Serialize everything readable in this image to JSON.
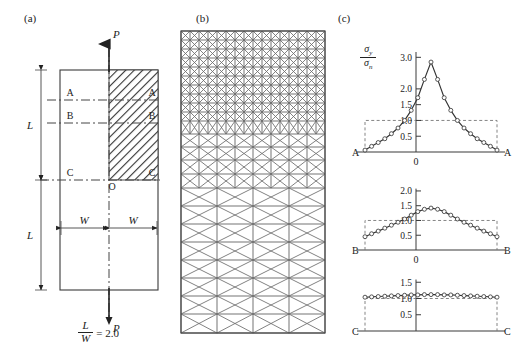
{
  "figure": {
    "panels": [
      {
        "id": "a",
        "label": "(a)",
        "x": 24,
        "y": 12
      },
      {
        "id": "b",
        "label": "(b)",
        "x": 196,
        "y": 12
      },
      {
        "id": "c",
        "label": "(c)",
        "x": 338,
        "y": 12
      }
    ]
  },
  "panel_a": {
    "title": "(a)",
    "load_label_top": "P",
    "load_label_bottom": "P",
    "origin_label": "O",
    "height_label_upper": "L",
    "height_label_lower": "L",
    "width_label_left": "W",
    "width_label_right": "W",
    "section_labels_left": [
      "A",
      "B",
      "C"
    ],
    "section_labels_right": [
      "A",
      "B",
      "C"
    ],
    "aspect_ratio_numerator": "L",
    "aspect_ratio_denominator": "W",
    "aspect_ratio_value": "= 2.0",
    "hatch_description": "hatched quadrant (modelled region)"
  },
  "panel_b": {
    "title": "(b)",
    "description": "graded finite element mesh of the modelled quadrant",
    "edge_section_labels": [
      "A",
      "B",
      "C"
    ]
  },
  "panel_c": {
    "title": "(c)",
    "y_axis_numerator": "σ",
    "y_axis_numerator_sub": "y",
    "y_axis_denominator": "σ",
    "y_axis_denominator_sub": "n",
    "plots": [
      {
        "name": "section-A",
        "left_label": "A",
        "right_label": "A",
        "origin_label": "0",
        "yticks": [
          "3.0",
          "2.0",
          "1.5",
          "1.0",
          "0.5"
        ],
        "ytick_values": [
          3.0,
          2.0,
          1.5,
          1.0,
          0.5
        ],
        "reference_level": 1.0,
        "peak": 2.85
      },
      {
        "name": "section-B",
        "left_label": "B",
        "right_label": "B",
        "origin_label": "0",
        "yticks": [
          "2.0",
          "1.5",
          "1.0",
          "0.5"
        ],
        "ytick_values": [
          2.0,
          1.5,
          1.0,
          0.5
        ],
        "reference_level": 1.0,
        "peak": 1.42
      },
      {
        "name": "section-C",
        "left_label": "C",
        "right_label": "C",
        "origin_label": "",
        "yticks": [
          "1.5",
          "1.0",
          "0.5"
        ],
        "ytick_values": [
          1.5,
          1.0,
          0.5
        ],
        "reference_level": 1.0,
        "peak": 1.12
      }
    ]
  },
  "chart_data": [
    {
      "type": "line",
      "name": "section-A",
      "title": "",
      "xlabel": "",
      "ylabel": "sigma_y / sigma_n",
      "xlim": [
        -1,
        1
      ],
      "ylim": [
        0,
        3.2
      ],
      "ytick_values": [
        0.5,
        1.0,
        1.5,
        2.0,
        3.0
      ],
      "reference_line": 1.0,
      "grid": false,
      "legend": false,
      "x": [
        -1.0,
        -0.9,
        -0.8,
        -0.7,
        -0.6,
        -0.5,
        -0.4,
        -0.3,
        -0.2,
        -0.1,
        0.0,
        0.1,
        0.2,
        0.3,
        0.4,
        0.5,
        0.6,
        0.7,
        0.8,
        0.9,
        1.0
      ],
      "y": [
        0.06,
        0.18,
        0.3,
        0.42,
        0.58,
        0.76,
        1.0,
        1.32,
        1.72,
        2.3,
        2.85,
        2.3,
        1.72,
        1.32,
        1.0,
        0.76,
        0.58,
        0.42,
        0.3,
        0.18,
        0.06
      ]
    },
    {
      "type": "line",
      "name": "section-B",
      "title": "",
      "xlabel": "",
      "ylabel": "sigma_y / sigma_n",
      "xlim": [
        -1,
        1
      ],
      "ylim": [
        0,
        2.1
      ],
      "ytick_values": [
        0.5,
        1.0,
        1.5,
        2.0
      ],
      "reference_line": 1.0,
      "grid": false,
      "legend": false,
      "x": [
        -1.0,
        -0.9,
        -0.8,
        -0.7,
        -0.6,
        -0.5,
        -0.4,
        -0.3,
        -0.2,
        -0.1,
        0.0,
        0.1,
        0.2,
        0.3,
        0.4,
        0.5,
        0.6,
        0.7,
        0.8,
        0.9,
        1.0
      ],
      "y": [
        0.45,
        0.55,
        0.64,
        0.74,
        0.84,
        0.94,
        1.05,
        1.18,
        1.3,
        1.38,
        1.42,
        1.38,
        1.3,
        1.18,
        1.05,
        0.94,
        0.84,
        0.74,
        0.64,
        0.55,
        0.45
      ]
    },
    {
      "type": "line",
      "name": "section-C",
      "title": "",
      "xlabel": "",
      "ylabel": "sigma_y / sigma_n",
      "xlim": [
        -1,
        1
      ],
      "ylim": [
        0,
        1.6
      ],
      "ytick_values": [
        0.5,
        1.0,
        1.5
      ],
      "reference_line": 1.0,
      "grid": false,
      "legend": false,
      "x": [
        -1.0,
        -0.9,
        -0.8,
        -0.7,
        -0.6,
        -0.5,
        -0.4,
        -0.3,
        -0.2,
        -0.1,
        0.0,
        0.1,
        0.2,
        0.3,
        0.4,
        0.5,
        0.6,
        0.7,
        0.8,
        0.9,
        1.0
      ],
      "y": [
        1.04,
        1.05,
        1.06,
        1.07,
        1.08,
        1.09,
        1.1,
        1.11,
        1.11,
        1.12,
        1.12,
        1.12,
        1.11,
        1.11,
        1.1,
        1.09,
        1.08,
        1.07,
        1.06,
        1.05,
        1.04
      ]
    }
  ]
}
